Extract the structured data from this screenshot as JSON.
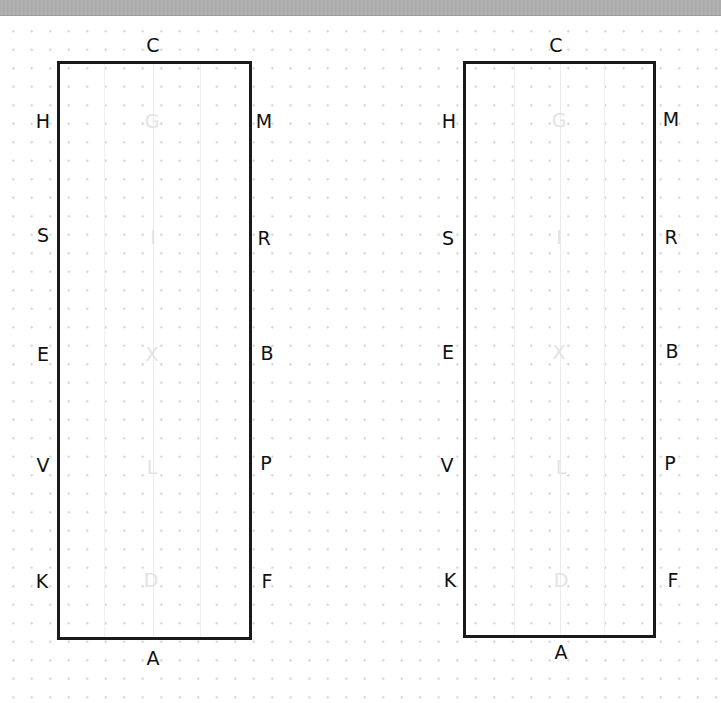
{
  "diagram": {
    "type": "dressage-arena-pair",
    "arenas": [
      {
        "id": "left",
        "top": "C",
        "bottom": "A",
        "left_side": [
          "H",
          "S",
          "E",
          "V",
          "K"
        ],
        "right_side": [
          "M",
          "R",
          "B",
          "P",
          "F"
        ],
        "centerline": [
          "G",
          "I",
          "X",
          "L",
          "D"
        ]
      },
      {
        "id": "right",
        "top": "C",
        "bottom": "A",
        "left_side": [
          "H",
          "S",
          "E",
          "V",
          "K"
        ],
        "right_side": [
          "M",
          "R",
          "B",
          "P",
          "F"
        ],
        "centerline": [
          "G",
          "I",
          "X",
          "L",
          "D"
        ]
      }
    ],
    "colors": {
      "border": "#1a1a1a",
      "letters": "#111111",
      "centerline_letters": "#e3e3e3",
      "grid_dots": "#d4d4d4",
      "top_bar": "#aaaaaa"
    }
  }
}
